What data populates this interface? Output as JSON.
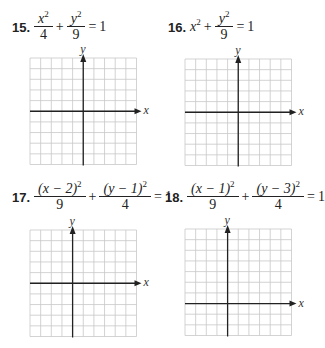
{
  "problems": [
    {
      "number": "15.",
      "equation": {
        "term1_num": "x",
        "term1_exp": "2",
        "term1_den": "4",
        "op": "+",
        "term2_num": "y",
        "term2_exp": "2",
        "term2_den": "9",
        "equals": "=",
        "rhs": "1"
      },
      "graph": {
        "cols": 10,
        "rows": 10,
        "yaxis_col": 5,
        "xaxis_row": 5,
        "x_label": "x",
        "y_label": "y"
      }
    },
    {
      "number": "16.",
      "equation": {
        "term1": "x",
        "term1_exp": "2",
        "op": "+",
        "term2_num": "y",
        "term2_exp": "2",
        "term2_den": "9",
        "equals": "=",
        "rhs": "1"
      },
      "graph": {
        "cols": 10,
        "rows": 10,
        "yaxis_col": 5,
        "xaxis_row": 5,
        "x_label": "x",
        "y_label": "y"
      }
    },
    {
      "number": "17.",
      "equation": {
        "term1_num": "(x − 2)",
        "term1_exp": "2",
        "term1_den": "9",
        "op": "+",
        "term2_num": "(y − 1)",
        "term2_exp": "2",
        "term2_den": "4",
        "equals": "=",
        "rhs": "1"
      },
      "graph": {
        "cols": 10,
        "rows": 10,
        "yaxis_col": 4,
        "xaxis_row": 5,
        "x_label": "x",
        "y_label": "y"
      }
    },
    {
      "number": "18.",
      "equation": {
        "term1_num": "(x − 1)",
        "term1_exp": "2",
        "term1_den": "9",
        "op": "+",
        "term2_num": "(y − 3)",
        "term2_exp": "2",
        "term2_den": "4",
        "equals": "=",
        "rhs": "1"
      },
      "graph": {
        "cols": 10,
        "rows": 10,
        "yaxis_col": 4,
        "xaxis_row": 7,
        "x_label": "x",
        "y_label": "y"
      }
    }
  ],
  "colors": {
    "grid": "#c8c8c8",
    "axis": "#222222",
    "text": "#222222"
  }
}
